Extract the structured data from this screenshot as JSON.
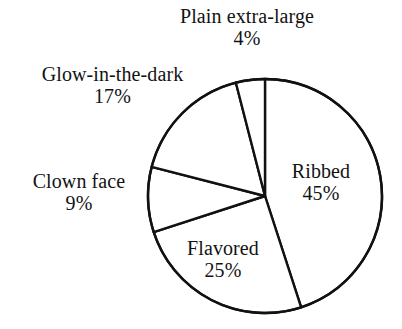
{
  "chart_data": {
    "type": "pie",
    "title": "",
    "subtitle": "",
    "xlabel": "",
    "ylabel": "",
    "legend_position": "none",
    "grid": false,
    "units": "percent",
    "start_angle_deg": 0,
    "direction": "clockwise",
    "categories": [
      "Ribbed",
      "Flavored",
      "Clown face",
      "Glow-in-the-dark",
      "Plain extra-large"
    ],
    "values": [
      45,
      25,
      9,
      17,
      4
    ],
    "slices": [
      {
        "label": "Ribbed",
        "value": 45,
        "percent_text": "45%",
        "label_placement": "inside",
        "color": "#ffffff",
        "outline": "#111111"
      },
      {
        "label": "Flavored",
        "value": 25,
        "percent_text": "25%",
        "label_placement": "inside",
        "color": "#ffffff",
        "outline": "#111111"
      },
      {
        "label": "Clown face",
        "value": 9,
        "percent_text": "9%",
        "label_placement": "outside-left",
        "color": "#ffffff",
        "outline": "#111111"
      },
      {
        "label": "Glow-in-the-dark",
        "value": 17,
        "percent_text": "17%",
        "label_placement": "outside-upper-left",
        "color": "#ffffff",
        "outline": "#111111"
      },
      {
        "label": "Plain extra-large",
        "value": 4,
        "percent_text": "4%",
        "label_placement": "outside-top",
        "color": "#ffffff",
        "outline": "#111111"
      }
    ]
  },
  "labels": {
    "plain": {
      "name": "Plain extra-large",
      "pct": "4%"
    },
    "glow": {
      "name": "Glow-in-the-dark",
      "pct": "17%"
    },
    "clown": {
      "name": "Clown face",
      "pct": "9%"
    },
    "ribbed": {
      "name": "Ribbed",
      "pct": "45%"
    },
    "flavored": {
      "name": "Flavored",
      "pct": "25%"
    }
  },
  "style": {
    "background": "#ffffff",
    "stroke": "#111111",
    "slice_fill": "#ffffff",
    "text_color": "#131313"
  },
  "geometry": {
    "center_x": 265,
    "center_y": 196,
    "radius": 117,
    "stroke_width": 2.4
  }
}
